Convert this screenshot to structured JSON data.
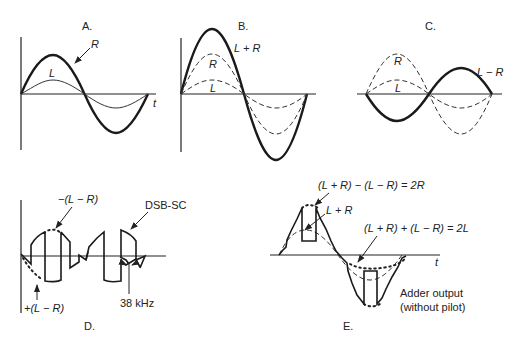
{
  "figure": {
    "panels": {
      "A": {
        "label": "A.",
        "axis_label": "t",
        "curves": [
          {
            "name": "R",
            "style": "thick solid",
            "amplitude": 1.0
          },
          {
            "name": "L",
            "style": "thin solid",
            "amplitude": 0.4
          }
        ],
        "labels": {
          "R": "R",
          "L": "L"
        }
      },
      "B": {
        "label": "B.",
        "curves": [
          {
            "name": "L + R",
            "style": "thick solid",
            "amplitude": 1.4
          },
          {
            "name": "R",
            "style": "dashed",
            "amplitude": 1.0
          },
          {
            "name": "L",
            "style": "dashed",
            "amplitude": 0.4
          }
        ],
        "labels": {
          "sum": "L + R",
          "R": "R",
          "L": "L"
        }
      },
      "C": {
        "label": "C.",
        "curves": [
          {
            "name": "L − R",
            "style": "thick solid",
            "amplitude": -0.6
          },
          {
            "name": "R",
            "style": "dashed",
            "amplitude": 1.0
          },
          {
            "name": "L",
            "style": "dashed",
            "amplitude": 0.4
          }
        ],
        "labels": {
          "diff": "L − R",
          "R": "R",
          "L": "L"
        }
      },
      "D": {
        "label": "D.",
        "labels": {
          "neg": "−(L − R)",
          "pos": "+(L − R)",
          "dsb": "DSB-SC",
          "freq": "38 kHz"
        }
      },
      "E": {
        "label": "E.",
        "axis_label": "t",
        "labels": {
          "eq_2R": "(L + R) − (L − R) = 2R",
          "sum": "L + R",
          "eq_2L": "(L + R) + (L − R) = 2L",
          "adder_line1": "Adder output",
          "adder_line2": "(without pilot)"
        }
      }
    }
  }
}
